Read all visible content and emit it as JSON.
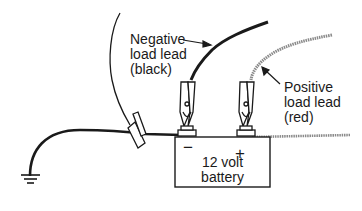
{
  "diagram": {
    "labels": {
      "negative": {
        "line1": "Negative",
        "line2": "load lead",
        "line3": "(black)"
      },
      "positive": {
        "line1": "Positive",
        "line2": "load lead",
        "line3": "(red)"
      }
    },
    "battery": {
      "line1": "12 volt",
      "line2": "battery",
      "negative_sign": "−",
      "positive_sign": "+"
    },
    "components": [
      "negative load lead",
      "positive load lead",
      "negative clamp",
      "positive clamp",
      "in-line clip",
      "12 volt battery",
      "ground symbol"
    ],
    "colors": {
      "ink": "#1a1a1a",
      "positive_lead": "#8a8a8a"
    }
  }
}
